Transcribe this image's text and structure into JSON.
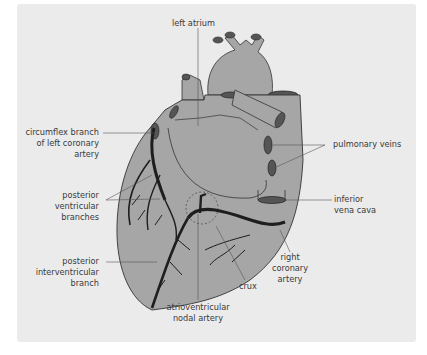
{
  "figure": {
    "colors": {
      "background": "#ebebeb",
      "heart_fill": "#a6a6a6",
      "vessel_dark": "#1e1e1e",
      "outline": "#333333",
      "leader_line": "#555555",
      "label_text": "#3a3a3a"
    },
    "labels": {
      "left_atrium": "left atrium",
      "circumflex_1": "circumflex branch",
      "circumflex_2": "of left coronary",
      "circumflex_3": "artery",
      "pulmonary_veins": "pulmonary veins",
      "post_vent_1": "posterior",
      "post_vent_2": "ventricular",
      "post_vent_3": "branches",
      "ivc_1": "inferior",
      "ivc_2": "vena cava",
      "piv_1": "posterior",
      "piv_2": "interventricular",
      "piv_3": "branch",
      "rca_1": "right",
      "rca_2": "coronary",
      "rca_3": "artery",
      "crux": "crux",
      "avn_1": "atrioventricular",
      "avn_2": "nodal artery"
    }
  }
}
